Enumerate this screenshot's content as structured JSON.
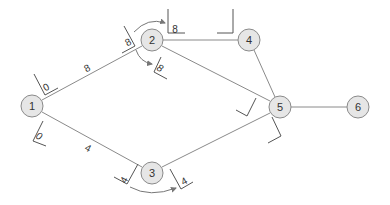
{
  "diagram": {
    "type": "network-graph",
    "nodes": [
      {
        "id": "1",
        "label": "1",
        "x": 32,
        "y": 106
      },
      {
        "id": "2",
        "label": "2",
        "x": 152,
        "y": 40
      },
      {
        "id": "3",
        "label": "3",
        "x": 152,
        "y": 173
      },
      {
        "id": "4",
        "label": "4",
        "x": 249,
        "y": 40
      },
      {
        "id": "5",
        "label": "5",
        "x": 280,
        "y": 107
      },
      {
        "id": "6",
        "label": "6",
        "x": 358,
        "y": 107
      }
    ],
    "edges": [
      {
        "from": "1",
        "to": "2",
        "weight": "8"
      },
      {
        "from": "1",
        "to": "3",
        "weight": "4"
      },
      {
        "from": "2",
        "to": "4",
        "weight": ""
      },
      {
        "from": "2",
        "to": "5",
        "weight": ""
      },
      {
        "from": "3",
        "to": "5",
        "weight": ""
      },
      {
        "from": "4",
        "to": "5",
        "weight": ""
      },
      {
        "from": "5",
        "to": "6",
        "weight": ""
      }
    ],
    "time_boxes": [
      {
        "near": "1",
        "position": "upper",
        "value": "0"
      },
      {
        "near": "1",
        "position": "lower",
        "value": "0"
      },
      {
        "near": "2",
        "position": "incoming",
        "value": "8"
      },
      {
        "near": "2",
        "position": "to-4",
        "value": "8"
      },
      {
        "near": "2",
        "position": "to-5",
        "value": "8"
      },
      {
        "near": "4",
        "position": "incoming",
        "value": ""
      },
      {
        "near": "5",
        "position": "from-2",
        "value": ""
      },
      {
        "near": "5",
        "position": "from-3",
        "value": ""
      },
      {
        "near": "3",
        "position": "incoming",
        "value": "4"
      },
      {
        "near": "3",
        "position": "outgoing",
        "value": "4"
      }
    ],
    "labels": {
      "n1": "1",
      "n2": "2",
      "n3": "3",
      "n4": "4",
      "n5": "5",
      "n6": "6",
      "e12": "8",
      "e13": "4",
      "t1_up": "0",
      "t1_down": "0",
      "t2_in": "8",
      "t2_to4": "8",
      "t2_to5": "8",
      "t3_in": "4",
      "t3_out": "4"
    }
  }
}
